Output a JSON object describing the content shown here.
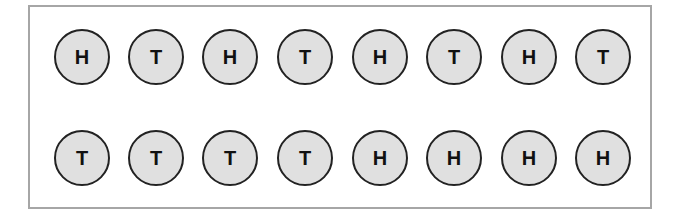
{
  "colors": {
    "frame_border": "#a6a6a6",
    "coin_fill": "#e0e0e0",
    "coin_border": "#222222",
    "text": "#111111"
  },
  "rows": [
    {
      "coins": [
        "H",
        "T",
        "H",
        "T",
        "H",
        "T",
        "H",
        "T"
      ]
    },
    {
      "coins": [
        "T",
        "T",
        "T",
        "T",
        "H",
        "H",
        "H",
        "H"
      ]
    }
  ]
}
